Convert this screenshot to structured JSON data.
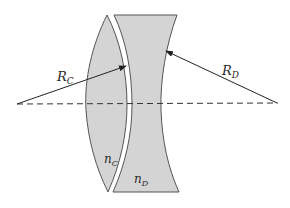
{
  "diagram": {
    "colors": {
      "lens_fill": "#d4d4d4",
      "lens_stroke": "#555555",
      "line": "#222222",
      "background": "#ffffff"
    },
    "labels": {
      "radius_c": {
        "main": "R",
        "sub": "C"
      },
      "radius_d": {
        "main": "R",
        "sub": "D"
      },
      "index_c": {
        "main": "n",
        "sub": "C"
      },
      "index_d": {
        "main": "n",
        "sub": "D"
      }
    },
    "elements": {
      "optical_axis": "dashed horizontal line",
      "lens_c": "biconvex lens (left)",
      "lens_d": "concave-faced lens (right)",
      "arrow_c": "radius arrow from left center point to lens C right surface",
      "arrow_d": "radius arrow from right center point to lens D right surface"
    }
  }
}
